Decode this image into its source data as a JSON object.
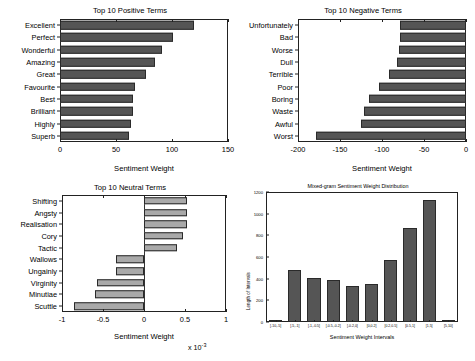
{
  "figure": {
    "background": "#ffffff",
    "bar_color_dark": "#555555",
    "bar_color_light": "#a9a9a9",
    "axis_color": "#222222"
  },
  "chart_data": [
    {
      "id": "positive",
      "type": "bar",
      "orientation": "horizontal",
      "title": "Top 10 Positive Terms",
      "xlabel": "Sentiment Weight",
      "ylabel": "",
      "xlim": [
        0,
        150
      ],
      "xticks": [
        0,
        50,
        100,
        150
      ],
      "xticklabels": [
        "0",
        "50",
        "100",
        "150"
      ],
      "grid": false,
      "legend": null,
      "categories": [
        "Excellent",
        "Perfect",
        "Wonderful",
        "Amazing",
        "Great",
        "Favourite",
        "Best",
        "Brilliant",
        "Highly",
        "Superb"
      ],
      "values": [
        120,
        101,
        91,
        85,
        77,
        67,
        65,
        65,
        63,
        62
      ]
    },
    {
      "id": "negative",
      "type": "bar",
      "orientation": "horizontal",
      "title": "Top 10 Negative Terms",
      "xlabel": "Sentiment Weight",
      "ylabel": "",
      "xlim": [
        -200,
        0
      ],
      "xticks": [
        -200,
        -150,
        -100,
        -50,
        0
      ],
      "xticklabels": [
        "-200",
        "-150",
        "-100",
        "-50",
        "0"
      ],
      "grid": false,
      "legend": null,
      "categories": [
        "Unfortunately",
        "Bad",
        "Worse",
        "Dull",
        "Terrible",
        "Poor",
        "Boring",
        "Waste",
        "Awful",
        "Worst"
      ],
      "values": [
        -79,
        -79,
        -80,
        -82,
        -92,
        -104,
        -115,
        -122,
        -125,
        -179
      ]
    },
    {
      "id": "neutral",
      "type": "bar",
      "orientation": "horizontal",
      "title": "Top 10 Neutral Terms",
      "xlabel": "Sentiment Weight",
      "ylabel": "",
      "xlim": [
        -1,
        1
      ],
      "xticks": [
        -1,
        -0.5,
        0,
        0.5,
        1
      ],
      "xticklabels": [
        "-1",
        "-0.5",
        "0",
        "0.5",
        "1"
      ],
      "exponent_label": "x 10",
      "exponent_power": "-3",
      "grid": false,
      "legend": null,
      "categories": [
        "Shifting",
        "Angsty",
        "Realisation",
        "Cory",
        "Tactic",
        "Wallows",
        "Ungainly",
        "Virginity",
        "Minutiae",
        "Scuttle"
      ],
      "values": [
        0.53,
        0.52,
        0.52,
        0.47,
        0.4,
        -0.34,
        -0.34,
        -0.57,
        -0.6,
        -0.85
      ]
    },
    {
      "id": "distribution",
      "type": "bar",
      "orientation": "vertical",
      "title": "Mixed-gram Sentiment Weight Distribution",
      "xlabel": "Sentiment Weight Intervals",
      "ylabel": "Length of Intervals",
      "ylim": [
        0,
        1200
      ],
      "yticks": [
        0,
        200,
        400,
        600,
        800,
        1000,
        1200
      ],
      "yticklabels": [
        "0",
        "200",
        "400",
        "600",
        "800",
        "1000",
        "1200"
      ],
      "grid": false,
      "legend": null,
      "categories": [
        "[-10,-5]",
        "[-5,-1]",
        "[-1,-0.5]",
        "[-0.5,-0.2]",
        "[-0.2,0]",
        "[0,0.2]",
        "[0.2,0.5]",
        "[0.5,1]",
        "[1,5]",
        "[5,10]"
      ],
      "values": [
        20,
        480,
        410,
        385,
        330,
        350,
        570,
        870,
        1130,
        20
      ]
    }
  ]
}
